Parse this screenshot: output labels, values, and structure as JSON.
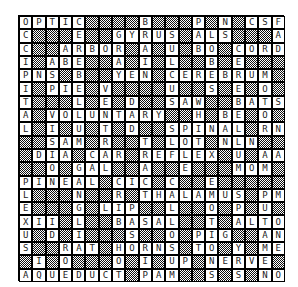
{
  "puzzle": {
    "type": "crossword",
    "size": [
      20,
      20
    ],
    "rows": [
      "OPTIC####B###P#N#CSF",
      "C###E##GYRUS#ALS###A",
      "C##ARBOR#A#U#BO#CORD",
      "I#ABE##A#I#L##B#E###",
      "PNS#B##YEN#CEREBRUM#",
      "I#PIE#V####U##S#E#O#",
      "T###L#E#D##SAW##BATS",
      "A#VOLUNTARY##H#BE#O#",
      "L#I#U#T#D##SPINAL#RN",
      "##SAM#R##T#LOT#NLN##",
      "#DIA#CAR#REFLEX#U#AA",
      "##O#GAL##A##E###MOM#",
      "PINEAL#CIC#C##E#####",
      "L###N##R#THALAMUS#PM",
      "E###G#LIP##L##O#P#U#",
      "XII#L##BASAL##T#ALTO",
      "U#D#I###S##O#PIG##AN",
      "S##RAT#HORNS#TO#Y#ME",
      "#I#O###O#I#UP#NERVE#",
      "AQUEDUCT#PAM##S#S#NO"
    ]
  }
}
